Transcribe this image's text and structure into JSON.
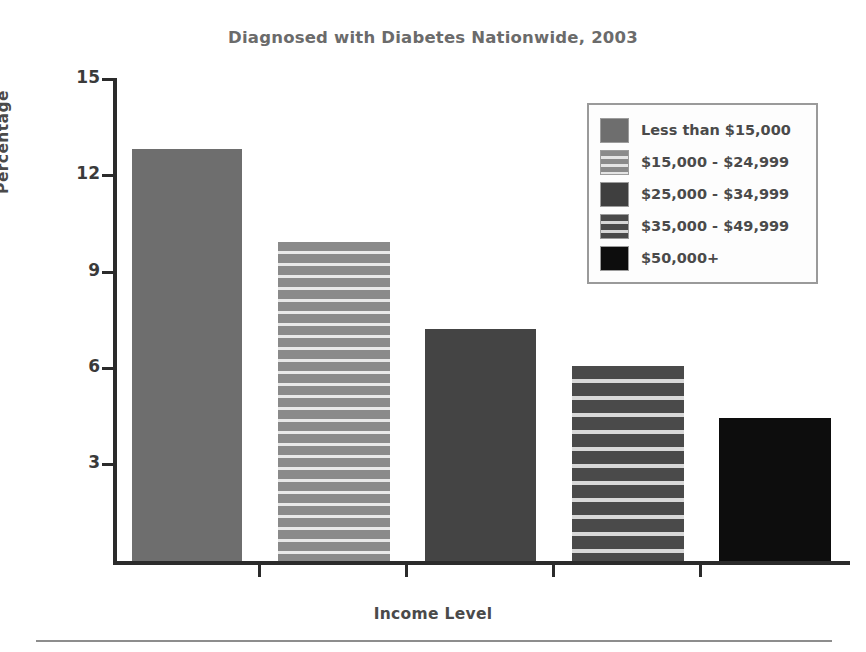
{
  "chart_data": {
    "type": "bar",
    "title": "Diagnosed with Diabetes Nationwide, 2003",
    "xlabel": "Income Level",
    "ylabel": "Percentage",
    "ylim": [
      0,
      15
    ],
    "yticks": [
      3,
      6,
      9,
      12,
      15
    ],
    "grid": false,
    "legend_position": "top-right",
    "categories": [
      "Less than $15,000",
      "$15,000 - $24,999",
      "$25,000 - $34,999",
      "$35,000 - $49,999",
      "$50,000+"
    ],
    "values": [
      12.8,
      9.9,
      7.2,
      6.05,
      4.45
    ],
    "series": [
      {
        "name": "Percentage diagnosed with diabetes",
        "values": [
          12.8,
          9.9,
          7.2,
          6.05,
          4.45
        ]
      }
    ],
    "bar_styles": [
      {
        "label": "Less than $15,000",
        "fill": "solid",
        "color": "#6e6e6e"
      },
      {
        "label": "$15,000 - $24,999",
        "fill": "striped",
        "color": "#8a8a8a"
      },
      {
        "label": "$25,000 - $34,999",
        "fill": "solid",
        "color": "#444444"
      },
      {
        "label": "$35,000 - $49,999",
        "fill": "striped",
        "color": "#4a4a4a"
      },
      {
        "label": "$50,000+",
        "fill": "solid",
        "color": "#0d0d0d"
      }
    ]
  },
  "legend": {
    "items": [
      {
        "label": "Less than $15,000"
      },
      {
        "label": "$15,000 - $24,999"
      },
      {
        "label": "$25,000 - $34,999"
      },
      {
        "label": "$35,000 - $49,999"
      },
      {
        "label": "$50,000+"
      }
    ]
  },
  "axis": {
    "y_tick_labels": [
      "15",
      "12",
      "9",
      "6",
      "3"
    ],
    "y_title": "Percentage",
    "x_title": "Income Level"
  },
  "colors": {
    "title": "#6b6b6b",
    "axis": "#2b2b2b",
    "text": "#4a4a4a",
    "legend_border": "#9a9a9a",
    "footer_rule": "#8d8d8d"
  }
}
